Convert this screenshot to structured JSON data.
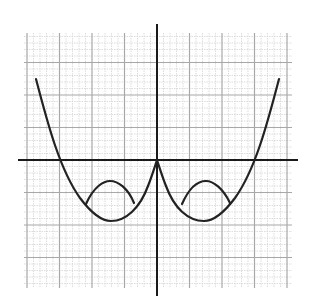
{
  "figure": {
    "colors": {
      "background": "#ffffff",
      "grid_minor": "#d4d4d4",
      "grid_major": "#a8a8a8",
      "axis": "#1a1a1a",
      "curve": "#222222"
    },
    "grid": {
      "left": 24,
      "top": 33,
      "right": 292,
      "bottom": 288,
      "origin_x": 157,
      "origin_y": 160,
      "major_spacing": 32.5,
      "minor_per_major": 5
    },
    "axes": {
      "x_axis": {
        "x1": 18,
        "x2": 298,
        "y": 160
      },
      "y_axis": {
        "x": 157,
        "y1": 24,
        "y2": 296
      }
    },
    "curves": [
      {
        "name": "left-branch",
        "path": "M36,79 C48,125 60,170 80,198 C92,214 102,221 111,221 C126,221 140,208 148,186 C152,176 155,166 157,160"
      },
      {
        "name": "right-branch",
        "path": "M157,160 C159,166 162,176 166,186 C174,208 188,221 204,221 C213,221 223,214 235,198 C255,170 267,125 279,79"
      },
      {
        "name": "left-arch",
        "path": "M86,204 C94,186 104,181 110,181 C118,181 128,188 134,203"
      },
      {
        "name": "right-arch",
        "path": "M182,204 C190,186 199,181 206,181 C213,181 223,188 230,203"
      }
    ]
  }
}
